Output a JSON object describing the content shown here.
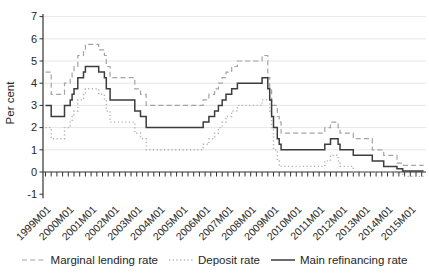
{
  "chart_data": {
    "type": "line",
    "title": "",
    "xlabel": "",
    "ylabel": "Per cent",
    "x_unit": "month",
    "x_start": "1999M01",
    "x_end": "2015M08",
    "ylim": [
      -1,
      7
    ],
    "y_ticks": [
      7,
      6,
      5,
      4,
      3,
      2,
      1,
      0,
      -1
    ],
    "x_tick_labels": [
      "1999M01",
      "2000M01",
      "2001M01",
      "2002M01",
      "2003M01",
      "2004M01",
      "2005M01",
      "2006M01",
      "2007M01",
      "2008M01",
      "2009M01",
      "2010M01",
      "2011M01",
      "2012M01",
      "2013M01",
      "2014M01",
      "2015M01"
    ],
    "x_minor_tick_interval_months": 3,
    "grid": "horizontal-light",
    "legend_position": "bottom-center",
    "interpolation": "step-after",
    "series": [
      {
        "name": "Marginal lending rate",
        "style": "dashed",
        "color": "#a4a4a4",
        "width": 1.2,
        "dash": "5 3.2",
        "steps": [
          [
            "1999M01",
            4.5
          ],
          [
            "1999M04",
            3.5
          ],
          [
            "1999M11",
            4.0
          ],
          [
            "2000M02",
            4.25
          ],
          [
            "2000M03",
            4.5
          ],
          [
            "2000M04",
            4.75
          ],
          [
            "2000M06",
            5.25
          ],
          [
            "2000M09",
            5.5
          ],
          [
            "2000M10",
            5.75
          ],
          [
            "2001M05",
            5.5
          ],
          [
            "2001M08",
            5.25
          ],
          [
            "2001M09",
            4.75
          ],
          [
            "2001M11",
            4.25
          ],
          [
            "2002M12",
            3.75
          ],
          [
            "2003M03",
            3.5
          ],
          [
            "2003M06",
            3.0
          ],
          [
            "2005M12",
            3.25
          ],
          [
            "2006M03",
            3.5
          ],
          [
            "2006M06",
            3.75
          ],
          [
            "2006M08",
            4.0
          ],
          [
            "2006M10",
            4.25
          ],
          [
            "2006M12",
            4.5
          ],
          [
            "2007M03",
            4.75
          ],
          [
            "2007M06",
            5.0
          ],
          [
            "2008M07",
            5.25
          ],
          [
            "2008M10",
            4.25
          ],
          [
            "2008M11",
            3.75
          ],
          [
            "2008M12",
            3.0
          ],
          [
            "2009M03",
            2.5
          ],
          [
            "2009M04",
            2.25
          ],
          [
            "2009M05",
            1.75
          ],
          [
            "2011M04",
            2.0
          ],
          [
            "2011M07",
            2.25
          ],
          [
            "2011M11",
            2.0
          ],
          [
            "2011M12",
            1.75
          ],
          [
            "2012M07",
            1.5
          ],
          [
            "2013M05",
            1.0
          ],
          [
            "2013M11",
            0.75
          ],
          [
            "2014M06",
            0.4
          ],
          [
            "2014M09",
            0.3
          ]
        ]
      },
      {
        "name": "Deposit rate",
        "style": "dotted",
        "color": "#b0b0b0",
        "width": 1.4,
        "dash": "1.2 2.5",
        "steps": [
          [
            "1999M01",
            2.0
          ],
          [
            "1999M04",
            1.5
          ],
          [
            "1999M11",
            2.0
          ],
          [
            "2000M02",
            2.25
          ],
          [
            "2000M03",
            2.5
          ],
          [
            "2000M04",
            2.75
          ],
          [
            "2000M06",
            3.25
          ],
          [
            "2000M09",
            3.5
          ],
          [
            "2000M10",
            3.75
          ],
          [
            "2001M05",
            3.5
          ],
          [
            "2001M08",
            3.25
          ],
          [
            "2001M09",
            2.75
          ],
          [
            "2001M11",
            2.25
          ],
          [
            "2002M12",
            1.75
          ],
          [
            "2003M03",
            1.5
          ],
          [
            "2003M06",
            1.0
          ],
          [
            "2005M12",
            1.25
          ],
          [
            "2006M03",
            1.5
          ],
          [
            "2006M06",
            1.75
          ],
          [
            "2006M08",
            2.0
          ],
          [
            "2006M10",
            2.25
          ],
          [
            "2006M12",
            2.5
          ],
          [
            "2007M03",
            2.75
          ],
          [
            "2007M06",
            3.0
          ],
          [
            "2008M07",
            3.25
          ],
          [
            "2008M11",
            2.75
          ],
          [
            "2008M12",
            2.0
          ],
          [
            "2009M01",
            1.0
          ],
          [
            "2009M03",
            0.5
          ],
          [
            "2009M04",
            0.25
          ],
          [
            "2011M04",
            0.5
          ],
          [
            "2011M07",
            0.75
          ],
          [
            "2011M11",
            0.5
          ],
          [
            "2011M12",
            0.25
          ],
          [
            "2012M07",
            0.0
          ],
          [
            "2014M06",
            -0.1
          ],
          [
            "2014M09",
            -0.2
          ]
        ]
      },
      {
        "name": "Main refinancing rate",
        "style": "solid",
        "color": "#3c3c3c",
        "width": 1.5,
        "dash": "",
        "steps": [
          [
            "1999M01",
            3.0
          ],
          [
            "1999M04",
            2.5
          ],
          [
            "1999M11",
            3.0
          ],
          [
            "2000M02",
            3.25
          ],
          [
            "2000M03",
            3.5
          ],
          [
            "2000M04",
            3.75
          ],
          [
            "2000M06",
            4.25
          ],
          [
            "2000M09",
            4.5
          ],
          [
            "2000M10",
            4.75
          ],
          [
            "2001M05",
            4.5
          ],
          [
            "2001M08",
            4.25
          ],
          [
            "2001M09",
            3.75
          ],
          [
            "2001M11",
            3.25
          ],
          [
            "2002M12",
            2.75
          ],
          [
            "2003M03",
            2.5
          ],
          [
            "2003M06",
            2.0
          ],
          [
            "2005M12",
            2.25
          ],
          [
            "2006M03",
            2.5
          ],
          [
            "2006M06",
            2.75
          ],
          [
            "2006M08",
            3.0
          ],
          [
            "2006M10",
            3.25
          ],
          [
            "2006M12",
            3.5
          ],
          [
            "2007M03",
            3.75
          ],
          [
            "2007M06",
            4.0
          ],
          [
            "2008M07",
            4.25
          ],
          [
            "2008M10",
            3.75
          ],
          [
            "2008M11",
            3.25
          ],
          [
            "2008M12",
            2.5
          ],
          [
            "2009M01",
            2.0
          ],
          [
            "2009M03",
            1.5
          ],
          [
            "2009M04",
            1.25
          ],
          [
            "2009M05",
            1.0
          ],
          [
            "2011M04",
            1.25
          ],
          [
            "2011M07",
            1.5
          ],
          [
            "2011M11",
            1.25
          ],
          [
            "2011M12",
            1.0
          ],
          [
            "2012M07",
            0.75
          ],
          [
            "2013M05",
            0.5
          ],
          [
            "2013M11",
            0.25
          ],
          [
            "2014M06",
            0.15
          ],
          [
            "2014M09",
            0.05
          ]
        ]
      }
    ],
    "colors": {
      "grid": "#e7e7e7",
      "axis": "#333333",
      "text": "#262626",
      "background": "#ffffff"
    },
    "layout": {
      "x0": 45.5,
      "px_per_month": 1.9,
      "y_zero": 172,
      "px_per_unit": 22.2,
      "plot_left": 43,
      "plot_right": 426,
      "axis_top": 14
    }
  }
}
